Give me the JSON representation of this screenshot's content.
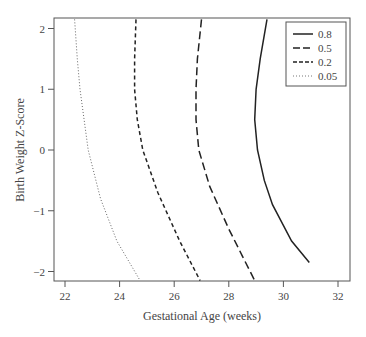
{
  "chart_data": {
    "type": "line",
    "title": "",
    "xlabel": "Gestational Age (weeks)",
    "ylabel": "Birth Weight Z-Score",
    "xlim": [
      21.6,
      32.4
    ],
    "ylim": [
      -2.15,
      2.15
    ],
    "xticks": [
      22,
      24,
      26,
      28,
      30,
      32
    ],
    "yticks": [
      -2,
      -1,
      0,
      1,
      2
    ],
    "grid": false,
    "legend_position": "top-right (inside)",
    "series": [
      {
        "name": "0.8",
        "style": "solid",
        "points": [
          [
            29.4,
            2.15
          ],
          [
            29.15,
            1.5
          ],
          [
            29.0,
            1.0
          ],
          [
            28.95,
            0.5
          ],
          [
            29.05,
            0.0
          ],
          [
            29.3,
            -0.5
          ],
          [
            29.6,
            -0.9
          ],
          [
            30.3,
            -1.5
          ],
          [
            30.95,
            -1.85
          ]
        ]
      },
      {
        "name": "0.5",
        "style": "long-dash",
        "points": [
          [
            27.0,
            2.15
          ],
          [
            26.85,
            1.5
          ],
          [
            26.8,
            1.0
          ],
          [
            26.8,
            0.5
          ],
          [
            26.9,
            0.0
          ],
          [
            27.3,
            -0.6
          ],
          [
            28.0,
            -1.3
          ],
          [
            28.5,
            -1.75
          ],
          [
            28.95,
            -2.15
          ]
        ]
      },
      {
        "name": "0.2",
        "style": "dash",
        "points": [
          [
            24.6,
            2.15
          ],
          [
            24.55,
            1.5
          ],
          [
            24.55,
            1.0
          ],
          [
            24.65,
            0.5
          ],
          [
            24.85,
            0.0
          ],
          [
            25.4,
            -0.7
          ],
          [
            26.2,
            -1.5
          ],
          [
            26.95,
            -2.15
          ]
        ]
      },
      {
        "name": "0.05",
        "style": "dotted",
        "points": [
          [
            22.35,
            2.15
          ],
          [
            22.45,
            1.5
          ],
          [
            22.55,
            1.0
          ],
          [
            22.7,
            0.5
          ],
          [
            22.85,
            0.0
          ],
          [
            23.3,
            -0.8
          ],
          [
            23.9,
            -1.5
          ],
          [
            24.75,
            -2.15
          ]
        ]
      }
    ]
  }
}
